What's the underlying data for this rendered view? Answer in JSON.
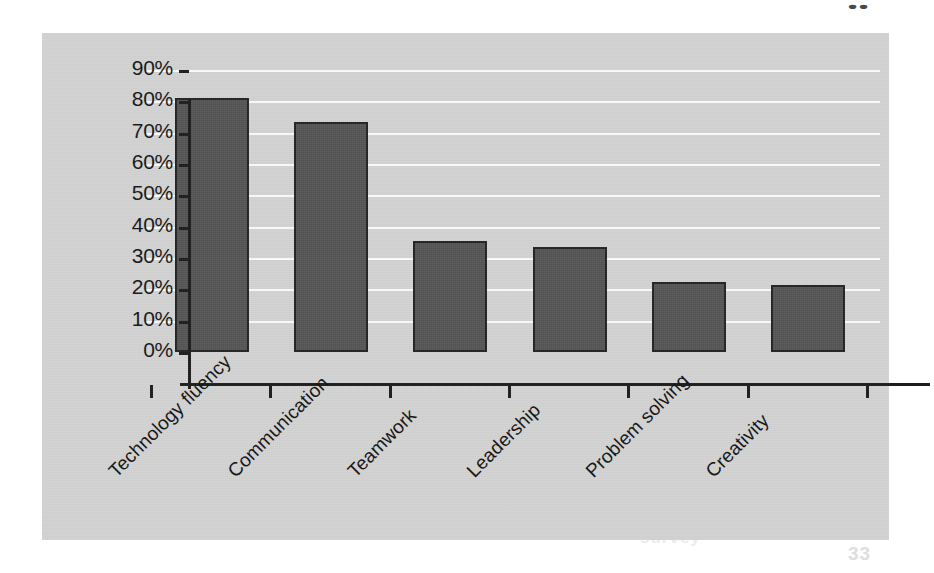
{
  "page": {
    "background_color": "#ffffff",
    "panel_color": "#d3d3d3",
    "gridline_color": "#fbfbfb",
    "axis_color": "#1d1d1d",
    "bar_fill_color": "#555555",
    "bar_border_color": "#232323"
  },
  "artifacts": {
    "top_right_mark": "••",
    "bottom_page_number": "33",
    "ghost_line_1": "quality",
    "ghost_line_2": "results",
    "ghost_line_3": "survey"
  },
  "chart_data": {
    "type": "bar",
    "title": "",
    "subtitle": "",
    "xlabel": "",
    "ylabel": "",
    "categories": [
      "Technology fluency",
      "Communication",
      "Teamwork",
      "Leadership",
      "Problem solving",
      "Creativity"
    ],
    "values": [
      81,
      73.5,
      35.5,
      33.5,
      22.5,
      21.5
    ],
    "value_labels": [
      "81%",
      "73.5%",
      "35.5%",
      "33.5%",
      "22.5%",
      "21.5%"
    ],
    "ylim": [
      0,
      90
    ],
    "ytick_values": [
      0,
      10,
      20,
      30,
      40,
      50,
      60,
      70,
      80,
      90
    ],
    "ytick_labels": [
      "0%",
      "10%",
      "20%",
      "30%",
      "40%",
      "50%",
      "60%",
      "70%",
      "80%",
      "90%"
    ],
    "grid": true,
    "grid_axis": "y",
    "legend": false,
    "legend_position": "none",
    "series": [
      {
        "name": "Share of respondents",
        "values": [
          81,
          73.5,
          35.5,
          33.5,
          22.5,
          21.5
        ]
      }
    ],
    "xtick_label_rotation": -45
  }
}
